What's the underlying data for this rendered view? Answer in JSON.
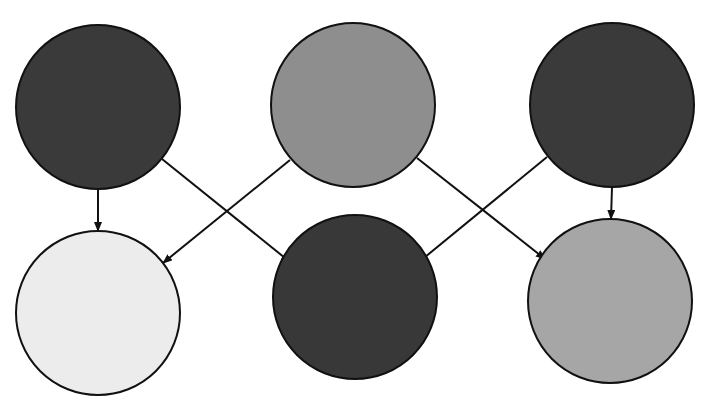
{
  "diagram": {
    "width": 712,
    "height": 410,
    "stroke_color": "#111111",
    "nodes": [
      {
        "id": "top-left",
        "cx": 98,
        "cy": 107,
        "r": 82,
        "fill": "#3a3a3a"
      },
      {
        "id": "top-middle",
        "cx": 353,
        "cy": 105,
        "r": 82,
        "fill": "#8e8e8e"
      },
      {
        "id": "top-right",
        "cx": 612,
        "cy": 105,
        "r": 82,
        "fill": "#3a3a3a"
      },
      {
        "id": "bottom-left",
        "cx": 98,
        "cy": 313,
        "r": 82,
        "fill": "#ececec"
      },
      {
        "id": "bottom-middle",
        "cx": 355,
        "cy": 297,
        "r": 82,
        "fill": "#383838"
      },
      {
        "id": "bottom-right",
        "cx": 610,
        "cy": 301,
        "r": 82,
        "fill": "#a6a6a6"
      }
    ],
    "edges": [
      {
        "from": "top-left",
        "to": "bottom-left",
        "x1": 98,
        "y1": 189,
        "x2": 98,
        "y2": 231
      },
      {
        "from": "top-left",
        "to": "bottom-middle",
        "x1": 162,
        "y1": 159,
        "x2": 290,
        "y2": 262
      },
      {
        "from": "top-middle",
        "to": "bottom-left",
        "x1": 290,
        "y1": 160,
        "x2": 163,
        "y2": 263
      },
      {
        "from": "top-middle",
        "to": "bottom-right",
        "x1": 417,
        "y1": 158,
        "x2": 545,
        "y2": 259
      },
      {
        "from": "top-right",
        "to": "bottom-middle",
        "x1": 547,
        "y1": 157,
        "x2": 419,
        "y2": 262
      },
      {
        "from": "top-right",
        "to": "bottom-right",
        "x1": 612,
        "y1": 187,
        "x2": 611,
        "y2": 219
      }
    ]
  }
}
